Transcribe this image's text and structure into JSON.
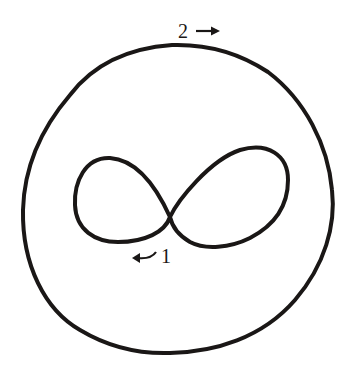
{
  "diagram": {
    "type": "closed-curves",
    "stroke_color": "#1a1716",
    "background_color": "#ffffff",
    "curves": [
      {
        "id": 1,
        "shape": "figure-eight",
        "label": "1",
        "arrow": "↙",
        "arrow_direction": "left (clockwise along lower left lobe)"
      },
      {
        "id": 2,
        "shape": "simple closed loop",
        "label": "2",
        "arrow": "→",
        "arrow_direction": "right (clockwise along top)"
      }
    ]
  },
  "labels": {
    "outer_number": "2",
    "outer_arrow": "→",
    "inner_number": "1",
    "inner_arrow": "↙"
  }
}
